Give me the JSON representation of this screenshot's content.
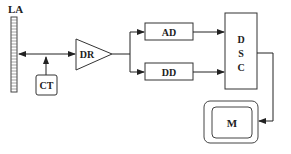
{
  "diagram": {
    "type": "block-diagram",
    "nodes": {
      "la": {
        "label": "LA",
        "shape": "linear-array"
      },
      "ct": {
        "label": "CT",
        "shape": "rounded-box"
      },
      "dr": {
        "label": "DR",
        "shape": "triangle-amplifier"
      },
      "ad": {
        "label": "AD",
        "shape": "box"
      },
      "dd": {
        "label": "DD",
        "shape": "box"
      },
      "dsc": {
        "label_lines": [
          "D",
          "S",
          "C"
        ],
        "shape": "tall-box"
      },
      "m": {
        "label": "M",
        "shape": "monitor"
      }
    },
    "edges": [
      {
        "from": "ct",
        "to": "bus"
      },
      {
        "from": "bus",
        "to": "la"
      },
      {
        "from": "bus",
        "to": "dr"
      },
      {
        "from": "dr",
        "to": "ad"
      },
      {
        "from": "dr",
        "to": "dd"
      },
      {
        "from": "ad",
        "to": "dsc"
      },
      {
        "from": "dd",
        "to": "dsc"
      },
      {
        "from": "dsc",
        "to": "m"
      }
    ],
    "colors": {
      "stroke": "#333333",
      "background": "#ffffff"
    }
  }
}
